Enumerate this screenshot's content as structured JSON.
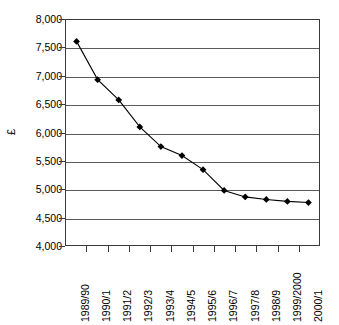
{
  "chart_data": {
    "type": "line",
    "title": "",
    "xlabel": "",
    "ylabel": "£",
    "ylim": [
      4000,
      8000
    ],
    "ytick_step": 500,
    "grid": true,
    "legend": "none",
    "marker": "diamond",
    "series_color": "#000000",
    "gridline_color": "#5a5a5a",
    "categories": [
      "1989/90",
      "1990/1",
      "1991/2",
      "1992/3",
      "1993/4",
      "1994/5",
      "1995/6",
      "1996/7",
      "1997/8",
      "1998/9",
      "1999/2000",
      "2000/1"
    ],
    "values": [
      7620,
      6940,
      6580,
      6100,
      5750,
      5590,
      5340,
      4970,
      4855,
      4810,
      4775,
      4755
    ],
    "ytick_labels": [
      "8,000",
      "7,500",
      "7,000",
      "6,500",
      "6,000",
      "5,500",
      "5,000",
      "4,500",
      "4,000"
    ],
    "ytick_values": [
      8000,
      7500,
      7000,
      6500,
      6000,
      5500,
      5000,
      4500,
      4000
    ]
  }
}
